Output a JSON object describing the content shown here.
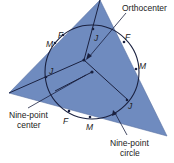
{
  "diagram": {
    "title": "Nine-point circle",
    "colors": {
      "triangle_fill": "#6f8bbf",
      "line": "#1a2140",
      "label": "#222222",
      "background": "#ffffff"
    },
    "labels": {
      "orthocenter": "Orthocenter",
      "nine_point_center_line1": "Nine-point",
      "nine_point_center_line2": "center",
      "nine_point_circle_line1": "Nine-point",
      "nine_point_circle_line2": "circle"
    },
    "point_labels": {
      "F_top_left": "F",
      "M_top_left": "M",
      "J_left": "J",
      "J_top": "J",
      "F_right": "F",
      "M_right": "M",
      "J_right": "J",
      "F_bottom": "F",
      "M_bottom": "M"
    }
  }
}
